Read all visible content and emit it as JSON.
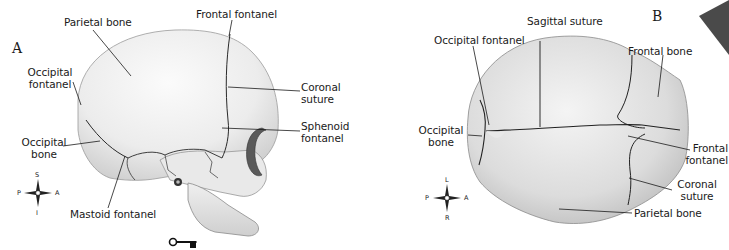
{
  "figure": {
    "panels": [
      {
        "id": "A",
        "letter": "A",
        "view": "lateral",
        "labels": {
          "parietal_bone": "Parietal bone",
          "frontal_fontanel": "Frontal fontanel",
          "occipital_fontanel_1": "Occipital",
          "occipital_fontanel_2": "fontanel",
          "coronal_suture_1": "Coronal",
          "coronal_suture_2": "suture",
          "sphenoid_fontanel_1": "Sphenoid",
          "sphenoid_fontanel_2": "fontanel",
          "occipital_bone_1": "Occipital",
          "occipital_bone_2": "bone",
          "mastoid_fontanel": "Mastoid fontanel"
        },
        "compass": {
          "top": "S",
          "bottom": "I",
          "left": "P",
          "right": "A"
        }
      },
      {
        "id": "B",
        "letter": "B",
        "view": "superior",
        "labels": {
          "sagittal_suture": "Sagittal suture",
          "occipital_fontanel": "Occipital fontanel",
          "frontal_bone": "Frontal bone",
          "occipital_bone_1": "Occipital",
          "occipital_bone_2": "bone",
          "frontal_fontanel_1": "Frontal",
          "frontal_fontanel_2": "fontanel",
          "coronal_suture_1": "Coronal",
          "coronal_suture_2": "suture",
          "parietal_bone": "Parietal bone"
        },
        "compass": {
          "top": "L",
          "bottom": "R",
          "left": "P",
          "right": "A"
        }
      }
    ],
    "key_icon": "key-icon",
    "corner_marker_color": "#4a4a4a"
  }
}
